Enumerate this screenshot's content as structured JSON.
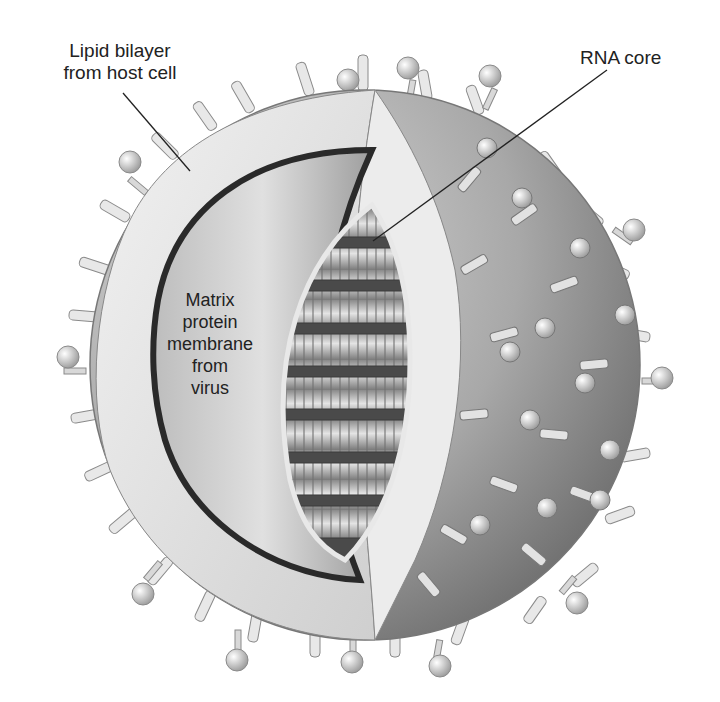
{
  "figure": {
    "labels": {
      "lipid_bilayer": {
        "line1": "Lipid bilayer",
        "line2": "from host cell"
      },
      "rna_core": {
        "text": "RNA core"
      },
      "matrix": {
        "line1": "Matrix",
        "line2": "protein",
        "line3": "membrane",
        "line4": "from",
        "line5": "virus"
      }
    },
    "colors": {
      "background": "#ffffff",
      "text": "#222222",
      "envelope_light": "#e6e6e6",
      "envelope_dark": "#8c8c8c",
      "core_dark": "#3a3a3a",
      "core_light": "#bdbdbd"
    }
  }
}
